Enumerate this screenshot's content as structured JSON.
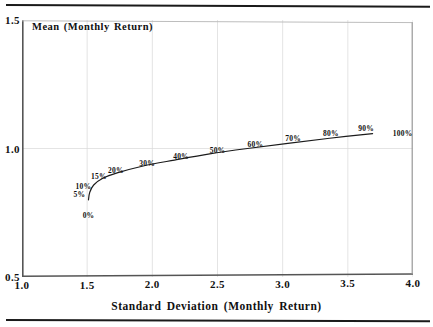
{
  "figure": {
    "top_rule": "horizontal-rule",
    "bottom_rule": "horizontal-rule"
  },
  "chart_data": {
    "type": "line",
    "title": "",
    "xlabel": "Standard Deviation (Monthly Return)",
    "ylabel": "Mean (Monthly Return)",
    "xlim": [
      1.0,
      4.0
    ],
    "ylim": [
      0.5,
      1.5
    ],
    "xticks": [
      "1.0",
      "1.5",
      "2.0",
      "2.5",
      "3.0",
      "3.5",
      "4.0"
    ],
    "xtick_values": [
      1.0,
      1.5,
      2.0,
      2.5,
      3.0,
      3.5,
      4.0
    ],
    "yticks": [
      "0.5",
      "1.0",
      "1.5"
    ],
    "ytick_values": [
      0.5,
      1.0,
      1.5
    ],
    "grid": true,
    "legend": "none",
    "series": [
      {
        "name": "efficient-frontier",
        "x": [
          1.51,
          1.52,
          1.55,
          1.62,
          1.73,
          1.93,
          2.17,
          2.44,
          2.73,
          3.04,
          3.36,
          3.69
        ],
        "y": [
          0.8,
          0.83,
          0.858,
          0.884,
          0.905,
          0.932,
          0.955,
          0.979,
          1.0,
          1.02,
          1.04,
          1.058
        ],
        "point_labels": [
          "0%",
          "5%",
          "10%",
          "15%",
          "20%",
          "30%",
          "40%",
          "50%",
          "60%",
          "70%",
          "80%",
          "90%"
        ]
      }
    ],
    "annotations": [
      {
        "label": "0%",
        "x": 1.51,
        "y": 0.742
      },
      {
        "label": "5%",
        "x": 1.44,
        "y": 0.822
      },
      {
        "label": "10%",
        "x": 1.47,
        "y": 0.856
      },
      {
        "label": "15%",
        "x": 1.59,
        "y": 0.893
      },
      {
        "label": "20%",
        "x": 1.72,
        "y": 0.916
      },
      {
        "label": "30%",
        "x": 1.96,
        "y": 0.944
      },
      {
        "label": "40%",
        "x": 2.22,
        "y": 0.971
      },
      {
        "label": "50%",
        "x": 2.5,
        "y": 0.996
      },
      {
        "label": "60%",
        "x": 2.79,
        "y": 1.019
      },
      {
        "label": "70%",
        "x": 3.08,
        "y": 1.04
      },
      {
        "label": "80%",
        "x": 3.37,
        "y": 1.06
      },
      {
        "label": "90%",
        "x": 3.64,
        "y": 1.08
      },
      {
        "label": "100%",
        "x": 3.92,
        "y": 1.06
      }
    ]
  }
}
